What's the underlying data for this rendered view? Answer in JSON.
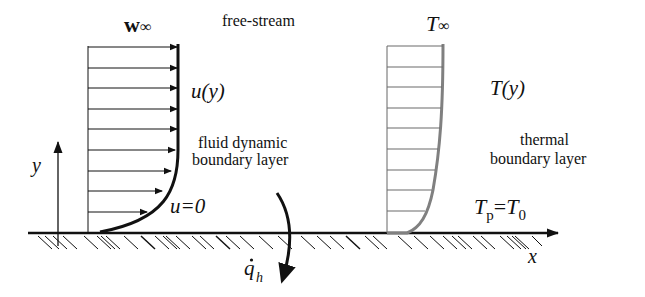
{
  "diagram": {
    "colors": {
      "ink": "#111111",
      "thermal_curve": "#808080",
      "thermal_lines": "#6a6a6a",
      "background": "#ffffff"
    },
    "labels": {
      "w_inf_base": "w",
      "w_inf_sub": "∞",
      "free_stream": "free-stream",
      "u_y": "u(y)",
      "fluid_bl_line1": "fluid dynamic",
      "fluid_bl_line2": "boundary layer",
      "u_zero": "u=0",
      "y_axis": "y",
      "x_axis": "x",
      "q_h_base": "q",
      "q_h_sub": "h",
      "q_h_dot": "·",
      "t_inf_base": "T",
      "t_inf_sub": "∞",
      "t_y": "T(y)",
      "thermal_bl_line1": "thermal",
      "thermal_bl_line2": "boundary layer",
      "tp_base": "T",
      "tp_sub": "p",
      "tp_eq": "=",
      "t0_base": "T",
      "t0_sub": "0"
    },
    "velocity_profile": {
      "arrow_count": 9
    },
    "temperature_profile": {
      "line_count": 9
    }
  }
}
